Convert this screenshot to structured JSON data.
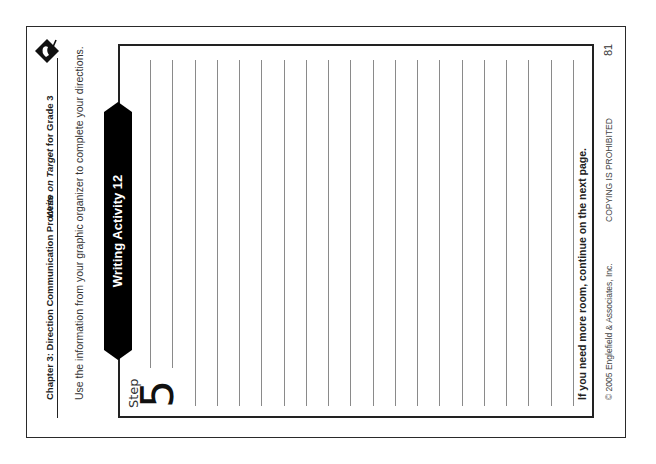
{
  "page": {
    "orientation": "rotated -90deg (landscape scan of portrait page)",
    "header": {
      "chapter": "Chapter 3: Direction Communication Process",
      "book_title_prefix": "Write on ",
      "book_title_target": "Target",
      "book_title_suffix": " for Grade 3",
      "logo": "diamond-target-logo-icon"
    },
    "instructions": "Use the information from your graphic organizer to complete your directions.",
    "banner": {
      "label": "Writing Activity 12",
      "color": "#000000"
    },
    "step": {
      "label": "Step",
      "number": "5"
    },
    "writing_area": {
      "line_count": 20,
      "line_color": "#8a8a8a"
    },
    "continue_note": "If you need more room, continue on the next page.",
    "footer": {
      "copyright": "© 2005 Englefield & Associates, Inc.",
      "notice": "COPYING IS PROHIBITED",
      "page_number": "81"
    }
  }
}
